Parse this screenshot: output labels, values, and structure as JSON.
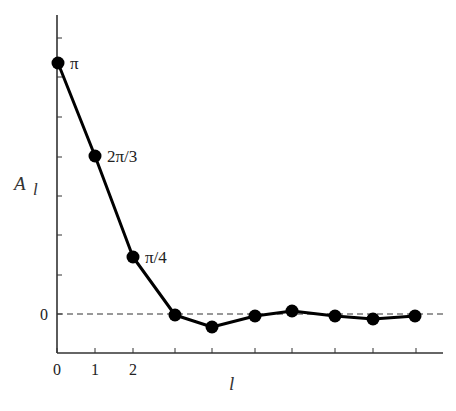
{
  "chart_data": {
    "type": "line",
    "title": "",
    "xlabel": "l",
    "ylabel": "A_l",
    "ylabel_main": "A",
    "ylabel_sub": "l",
    "x": [
      0,
      1,
      2,
      3,
      4,
      5,
      6,
      7,
      8,
      9
    ],
    "x_tick_labels": [
      "0",
      "1",
      "2",
      "",
      "",
      "",
      "",
      "",
      "",
      ""
    ],
    "y_tick_labels": [
      "0"
    ],
    "values": [
      3.1416,
      2.0944,
      0.7854,
      0.0,
      -0.15,
      -0.02,
      0.05,
      -0.02,
      -0.06,
      -0.02
    ],
    "point_labels": [
      "π",
      "2π/3",
      "π/4",
      "",
      "",
      "",
      "",
      "",
      "",
      ""
    ],
    "reference_line": {
      "y": 0,
      "style": "dashed"
    },
    "ylim": [
      -0.5,
      3.6
    ],
    "grid": false,
    "legend": null
  },
  "render": {
    "axis": {
      "x0": 57,
      "y_top": 15,
      "y_bottom": 353,
      "x_end": 443
    },
    "zero_y": 314,
    "y_ticks_px": [
      38,
      77,
      117,
      157,
      196,
      235,
      275,
      314
    ],
    "x_ticks_px": [
      57,
      95,
      133,
      175,
      212,
      255,
      292,
      335,
      373,
      416
    ],
    "points_px": [
      [
        58,
        63
      ],
      [
        95,
        156
      ],
      [
        133,
        257
      ],
      [
        175,
        315
      ],
      [
        212,
        327
      ],
      [
        255,
        316
      ],
      [
        292,
        311
      ],
      [
        335,
        316
      ],
      [
        373,
        319
      ],
      [
        415,
        316
      ]
    ],
    "colors": {
      "line": "#000000",
      "axis": "#333333",
      "dash": "#333333"
    }
  }
}
